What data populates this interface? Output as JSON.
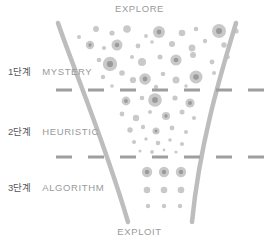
{
  "diagram": {
    "title_top": "EXPLORE",
    "title_bottom": "EXPLOIT",
    "colors": {
      "funnel_stroke": "#bdbdbd",
      "dot_outer": "#c9c9c9",
      "dot_inner": "#9a9a9a",
      "dash_line": "#9e9e9e",
      "step_text": "#55565a",
      "name_text": "#9a9a9a",
      "background": "#ffffff"
    },
    "stages": [
      {
        "step": "1단계",
        "name": "MYSTERY"
      },
      {
        "step": "2단계",
        "name": "HEURISTIC"
      },
      {
        "step": "3단계",
        "name": "ALGORITHM"
      }
    ],
    "divider_lines": [
      {
        "y": 90,
        "dash": "16 16"
      },
      {
        "y": 157,
        "dash": "16 16"
      }
    ],
    "funnel": {
      "left_path": "M 58 23 C 74 70, 104 140, 128 222",
      "right_path": "M 236 23 C 222 70, 200 140, 192 222",
      "stroke_width": 4.5
    },
    "dots": [
      {
        "x": 96,
        "y": 29,
        "r": 3.0,
        "core": 0
      },
      {
        "x": 79,
        "y": 37,
        "r": 2.0,
        "core": 0
      },
      {
        "x": 112,
        "y": 33,
        "r": 2.6,
        "core": 0
      },
      {
        "x": 127,
        "y": 29,
        "r": 3.8,
        "core": 0
      },
      {
        "x": 146,
        "y": 36,
        "r": 1.9,
        "core": 0
      },
      {
        "x": 160,
        "y": 30,
        "r": 2.6,
        "core": 0
      },
      {
        "x": 159,
        "y": 32,
        "r": 6.0,
        "core": 2.4
      },
      {
        "x": 182,
        "y": 33,
        "r": 3.3,
        "core": 0
      },
      {
        "x": 196,
        "y": 29,
        "r": 2.3,
        "core": 0
      },
      {
        "x": 219,
        "y": 31,
        "r": 7.0,
        "core": 3.0
      },
      {
        "x": 236,
        "y": 31,
        "r": 2.6,
        "core": 0
      },
      {
        "x": 90,
        "y": 45,
        "r": 4.2,
        "core": 1.7
      },
      {
        "x": 104,
        "y": 48,
        "r": 2.1,
        "core": 0
      },
      {
        "x": 118,
        "y": 41,
        "r": 1.6,
        "core": 0
      },
      {
        "x": 138,
        "y": 46,
        "r": 2.4,
        "core": 0
      },
      {
        "x": 152,
        "y": 42,
        "r": 1.8,
        "core": 0
      },
      {
        "x": 172,
        "y": 44,
        "r": 3.0,
        "core": 0
      },
      {
        "x": 192,
        "y": 48,
        "r": 3.4,
        "core": 0
      },
      {
        "x": 205,
        "y": 41,
        "r": 2.2,
        "core": 0
      },
      {
        "x": 224,
        "y": 45,
        "r": 2.7,
        "core": 0
      },
      {
        "x": 117,
        "y": 45,
        "r": 5.5,
        "core": 2.2
      },
      {
        "x": 99,
        "y": 60,
        "r": 2.3,
        "core": 0
      },
      {
        "x": 110,
        "y": 64,
        "r": 7.2,
        "core": 3.1
      },
      {
        "x": 132,
        "y": 57,
        "r": 2.0,
        "core": 0
      },
      {
        "x": 142,
        "y": 62,
        "r": 4.0,
        "core": 0
      },
      {
        "x": 160,
        "y": 57,
        "r": 2.5,
        "core": 0
      },
      {
        "x": 176,
        "y": 60,
        "r": 5.6,
        "core": 2.3
      },
      {
        "x": 193,
        "y": 55,
        "r": 3.0,
        "core": 0
      },
      {
        "x": 212,
        "y": 62,
        "r": 2.4,
        "core": 0
      },
      {
        "x": 228,
        "y": 57,
        "r": 1.9,
        "core": 0
      },
      {
        "x": 103,
        "y": 77,
        "r": 2.2,
        "core": 0
      },
      {
        "x": 122,
        "y": 73,
        "r": 2.8,
        "core": 0
      },
      {
        "x": 133,
        "y": 80,
        "r": 3.1,
        "core": 0
      },
      {
        "x": 145,
        "y": 79,
        "r": 5.8,
        "core": 2.4
      },
      {
        "x": 163,
        "y": 74,
        "r": 2.3,
        "core": 0
      },
      {
        "x": 176,
        "y": 80,
        "r": 3.5,
        "core": 0
      },
      {
        "x": 196,
        "y": 77,
        "r": 6.5,
        "core": 2.8
      },
      {
        "x": 214,
        "y": 73,
        "r": 2.0,
        "core": 0
      },
      {
        "x": 112,
        "y": 86,
        "r": 1.8,
        "core": 0
      },
      {
        "x": 156,
        "y": 87,
        "r": 2.2,
        "core": 0
      },
      {
        "x": 186,
        "y": 86,
        "r": 1.7,
        "core": 0
      },
      {
        "x": 126,
        "y": 101,
        "r": 4.4,
        "core": 1.9
      },
      {
        "x": 142,
        "y": 98,
        "r": 2.3,
        "core": 0
      },
      {
        "x": 155,
        "y": 100,
        "r": 6.8,
        "core": 2.9
      },
      {
        "x": 175,
        "y": 98,
        "r": 2.6,
        "core": 0
      },
      {
        "x": 190,
        "y": 103,
        "r": 4.6,
        "core": 2.0
      },
      {
        "x": 122,
        "y": 114,
        "r": 2.4,
        "core": 0
      },
      {
        "x": 136,
        "y": 118,
        "r": 3.2,
        "core": 0
      },
      {
        "x": 150,
        "y": 112,
        "r": 2.0,
        "core": 0
      },
      {
        "x": 166,
        "y": 116,
        "r": 4.1,
        "core": 1.7
      },
      {
        "x": 182,
        "y": 112,
        "r": 2.5,
        "core": 0
      },
      {
        "x": 194,
        "y": 118,
        "r": 2.1,
        "core": 0
      },
      {
        "x": 130,
        "y": 130,
        "r": 2.7,
        "core": 0
      },
      {
        "x": 143,
        "y": 127,
        "r": 2.2,
        "core": 0
      },
      {
        "x": 156,
        "y": 131,
        "r": 3.6,
        "core": 1.5
      },
      {
        "x": 172,
        "y": 128,
        "r": 2.4,
        "core": 0
      },
      {
        "x": 186,
        "y": 132,
        "r": 2.0,
        "core": 0
      },
      {
        "x": 134,
        "y": 142,
        "r": 2.1,
        "core": 0
      },
      {
        "x": 146,
        "y": 139,
        "r": 1.7,
        "core": 0
      },
      {
        "x": 158,
        "y": 143,
        "r": 2.3,
        "core": 0
      },
      {
        "x": 170,
        "y": 140,
        "r": 1.8,
        "core": 0
      },
      {
        "x": 182,
        "y": 144,
        "r": 2.0,
        "core": 0
      },
      {
        "x": 140,
        "y": 151,
        "r": 1.5,
        "core": 0
      },
      {
        "x": 152,
        "y": 152,
        "r": 1.9,
        "core": 0
      },
      {
        "x": 164,
        "y": 150,
        "r": 1.4,
        "core": 0
      },
      {
        "x": 176,
        "y": 152,
        "r": 1.6,
        "core": 0
      },
      {
        "x": 147,
        "y": 172,
        "r": 5.2,
        "core": 2.2
      },
      {
        "x": 164,
        "y": 172,
        "r": 5.2,
        "core": 2.2
      },
      {
        "x": 181,
        "y": 172,
        "r": 5.2,
        "core": 2.2
      },
      {
        "x": 147,
        "y": 190,
        "r": 3.3,
        "core": 0
      },
      {
        "x": 164,
        "y": 190,
        "r": 3.3,
        "core": 0
      },
      {
        "x": 181,
        "y": 190,
        "r": 3.3,
        "core": 0
      },
      {
        "x": 148,
        "y": 206,
        "r": 2.2,
        "core": 0
      },
      {
        "x": 164,
        "y": 206,
        "r": 2.2,
        "core": 0
      },
      {
        "x": 180,
        "y": 206,
        "r": 2.2,
        "core": 0
      }
    ]
  }
}
